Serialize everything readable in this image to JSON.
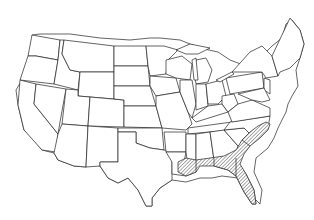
{
  "map": {
    "title": "",
    "region": "Contiguous United States",
    "style": "state outline map",
    "highlight": {
      "pattern": "diagonal hatch",
      "color": "#555555",
      "areas": [
        "Southern Louisiana",
        "Southern Mississippi",
        "Southern Alabama",
        "Southern Georgia",
        "Florida",
        "Coastal South Carolina",
        "Coastal North Carolina"
      ]
    },
    "outline_color": "#222222",
    "background": "#ffffff"
  }
}
